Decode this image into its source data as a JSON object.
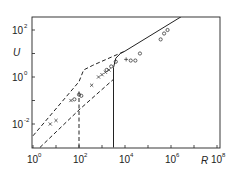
{
  "chart_data": {
    "type": "scatter",
    "title": "",
    "xlabel": "R",
    "ylabel": "U",
    "xscale": "log",
    "yscale": "log",
    "xlim": [
      1,
      100000000
    ],
    "ylim": [
      0.001,
      350
    ],
    "grid": false,
    "legend": null,
    "x_ticks": [
      {
        "base": "10",
        "exp": "0",
        "value": 1
      },
      {
        "base": "10",
        "exp": "2",
        "value": 100
      },
      {
        "base": "10",
        "exp": "4",
        "value": 10000
      },
      {
        "base": "10",
        "exp": "6",
        "value": 1000000
      },
      {
        "base": "10",
        "exp": "8",
        "value": 100000000
      }
    ],
    "y_ticks": [
      {
        "base": "10",
        "exp": "2",
        "value": 100
      },
      {
        "base": "10",
        "exp": "0",
        "value": 1
      },
      {
        "base": "10",
        "exp": "-2",
        "value": 0.01
      }
    ],
    "series": [
      {
        "name": "solid curve",
        "style": "solid",
        "log_points": [
          [
            3.5,
            -3.0
          ],
          [
            3.5,
            0.4
          ],
          [
            3.6,
            0.8
          ],
          [
            3.8,
            1.0
          ],
          [
            4.0,
            1.1
          ],
          [
            6.5,
            2.6
          ]
        ]
      },
      {
        "name": "upper dashed curve",
        "style": "dashed",
        "log_points": [
          [
            0.0,
            -2.5
          ],
          [
            2.0,
            -0.2
          ],
          [
            2.2,
            0.3
          ],
          [
            2.6,
            0.5
          ],
          [
            4.0,
            1.1
          ]
        ]
      },
      {
        "name": "lower dashed curve",
        "style": "dashed",
        "log_points": [
          [
            0.3,
            -3.0
          ],
          [
            2.0,
            -1.4
          ],
          [
            3.5,
            -0.1
          ]
        ]
      },
      {
        "name": "vertical dashed line",
        "style": "dashed",
        "log_points": [
          [
            2.0,
            -3.0
          ],
          [
            2.0,
            -0.6
          ]
        ]
      },
      {
        "name": "crosses",
        "marker": "x",
        "log_points": [
          [
            0.75,
            -2.0
          ],
          [
            1.0,
            -1.85
          ],
          [
            1.65,
            -1.0
          ],
          [
            2.55,
            -0.35
          ],
          [
            2.85,
            0.0
          ],
          [
            3.0,
            0.1
          ],
          [
            3.15,
            0.2
          ],
          [
            3.3,
            0.3
          ]
        ]
      },
      {
        "name": "circles",
        "marker": "o",
        "log_points": [
          [
            1.8,
            -0.95
          ],
          [
            2.0,
            -0.75
          ],
          [
            2.1,
            -0.8
          ],
          [
            3.2,
            0.3
          ],
          [
            3.4,
            0.45
          ],
          [
            3.6,
            0.65
          ],
          [
            4.25,
            0.7
          ],
          [
            4.45,
            0.7
          ],
          [
            4.65,
            1.0
          ],
          [
            5.55,
            1.6
          ],
          [
            5.7,
            1.85
          ],
          [
            5.85,
            2.0
          ]
        ]
      },
      {
        "name": "plus",
        "marker": "+",
        "log_points": [
          [
            4.05,
            0.75
          ]
        ]
      }
    ],
    "annotations": []
  }
}
